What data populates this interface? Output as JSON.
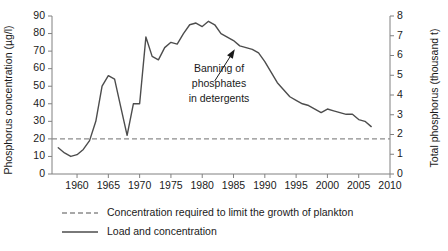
{
  "chart_data": {
    "type": "line",
    "title": "",
    "xlabel": "",
    "ylabel": "Phosphorus concentration (µg/l)",
    "y2label": "Total phosphorus (thousand t)",
    "xlim": [
      1956,
      2010
    ],
    "ylim": [
      0,
      90
    ],
    "y2lim": [
      0,
      8
    ],
    "grid": false,
    "legend_position": "bottom-left",
    "x_ticks": [
      "1960",
      "1965",
      "1970",
      "1975",
      "1980",
      "1985",
      "1990",
      "1995",
      "2000",
      "2005",
      "2010"
    ],
    "x_tick_values": [
      1960,
      1965,
      1970,
      1975,
      1980,
      1985,
      1990,
      1995,
      2000,
      2005,
      2010
    ],
    "y_ticks": [
      "0",
      "10",
      "20",
      "30",
      "40",
      "50",
      "60",
      "70",
      "80",
      "90"
    ],
    "y_tick_values": [
      0,
      10,
      20,
      30,
      40,
      50,
      60,
      70,
      80,
      90
    ],
    "y2_ticks": [
      "0",
      "1",
      "2",
      "3",
      "4",
      "5",
      "6",
      "7",
      "8"
    ],
    "y2_tick_values": [
      0,
      1,
      2,
      3,
      4,
      5,
      6,
      7,
      8
    ],
    "threshold_value": 20,
    "series": [
      {
        "name": "Load and concentration",
        "style": "solid",
        "color": "#4d4d4d",
        "x": [
          1957,
          1958,
          1959,
          1960,
          1961,
          1962,
          1963,
          1964,
          1965,
          1966,
          1967,
          1968,
          1969,
          1970,
          1971,
          1972,
          1973,
          1974,
          1975,
          1976,
          1977,
          1978,
          1979,
          1980,
          1981,
          1982,
          1983,
          1984,
          1985,
          1986,
          1987,
          1988,
          1989,
          1990,
          1991,
          1992,
          1993,
          1994,
          1995,
          1996,
          1997,
          1998,
          1999,
          2000,
          2001,
          2002,
          2003,
          2004,
          2005,
          2006,
          2007
        ],
        "values": [
          15,
          12,
          10,
          11,
          14,
          19,
          30,
          50,
          56,
          54,
          38,
          22,
          40,
          40,
          78,
          67,
          65,
          72,
          75,
          74,
          80,
          85,
          86,
          84,
          87,
          85,
          80,
          78,
          76,
          73,
          72,
          71,
          69,
          64,
          58,
          52,
          48,
          44,
          42,
          40,
          39,
          37,
          35,
          37,
          36,
          35,
          34,
          34,
          31,
          30,
          27
        ]
      },
      {
        "name": "Concentration required to limit the growth of plankton",
        "style": "dashed",
        "color": "#8c8c8c",
        "constant_value": 20
      }
    ],
    "annotations": [
      {
        "text_lines": [
          "Banning of",
          "phosphates",
          "in detergents"
        ],
        "arrow_from_x": 1982.0,
        "arrow_from_y": 53,
        "arrow_to_x": 1985.2,
        "arrow_to_y": 71
      }
    ]
  },
  "legend": {
    "items": [
      {
        "label": "Concentration required to limit the growth of plankton",
        "style": "dashed",
        "color": "#8c8c8c"
      },
      {
        "label": "Load and concentration",
        "style": "solid",
        "color": "#4d4d4d"
      }
    ]
  },
  "colors": {
    "line": "#4d4d4d",
    "threshold": "#8c8c8c",
    "axis": "#808080",
    "text": "#1a1a1a",
    "background": "#ffffff"
  }
}
